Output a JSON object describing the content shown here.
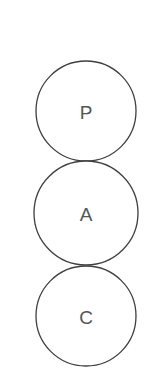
{
  "diagram": {
    "type": "stacked-circles",
    "stroke_color": "#3f3f3f",
    "label_color": "#555555",
    "nodes": [
      {
        "label": "P",
        "cx": 86,
        "cy": 111,
        "r": 50
      },
      {
        "label": "A",
        "cx": 86,
        "cy": 213,
        "r": 52
      },
      {
        "label": "C",
        "cx": 86,
        "cy": 316,
        "r": 50
      }
    ]
  }
}
